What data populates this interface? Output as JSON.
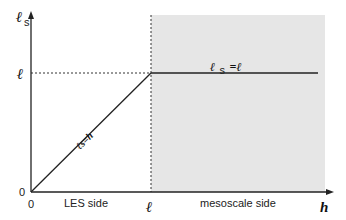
{
  "diagram": {
    "y_axis_label": "ℓ",
    "y_axis_sub": "s",
    "x_axis_label": "h",
    "y_tick_l": "ℓ",
    "y_tick_0": "0",
    "x_tick_0": "0",
    "x_tick_l": "ℓ",
    "diag_label": "ℓs=h",
    "flat_label_main": "ℓ",
    "flat_label_sub": "s",
    "flat_label_rest": "=ℓ",
    "region_left": "LES side",
    "region_right": "mesoscale side",
    "shade_color": "#e6e6e6"
  }
}
